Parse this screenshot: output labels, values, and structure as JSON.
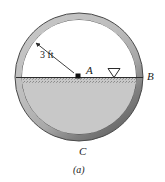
{
  "figure": {
    "caption": "(a)",
    "labels": {
      "dimension": "3 ft",
      "center_point": "A",
      "right_point": "B",
      "bottom_point": "C"
    },
    "icons": {
      "water_level_symbol": "water-level-triangle-icon",
      "center_dot": "point-marker-dot",
      "dimension_arrow": "radius-arrow-icon"
    },
    "geometry": {
      "circle_center_x": 79,
      "circle_center_y": 77,
      "outer_radius": 64,
      "inner_radius": 57,
      "water_line_y": 77
    },
    "colors": {
      "wall_light": "#b8b8b8",
      "wall_shadow": "#6e6e6e",
      "water_fill": "#c8c8c8",
      "air_fill": "#ffffff",
      "outline": "#3a3a3a",
      "background": "#ffffff",
      "text": "#1a1a1a"
    }
  }
}
